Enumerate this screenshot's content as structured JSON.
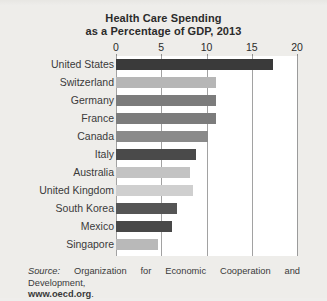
{
  "chart_data": {
    "type": "bar",
    "orientation": "horizontal",
    "title": "Health Care Spending as a Percentage of GDP, 2013",
    "title_lines": [
      "Health Care Spending",
      "as a Percentage of GDP, 2013"
    ],
    "xlabel": "",
    "ylabel": "",
    "xlim": [
      0,
      20
    ],
    "xticks": [
      0,
      5,
      10,
      15,
      20
    ],
    "xtick_labels": [
      "0",
      "5",
      "10",
      "15",
      "20"
    ],
    "grid": true,
    "legend": "none",
    "categories": [
      "United States",
      "Switzerland",
      "Germany",
      "France",
      "Canada",
      "Italy",
      "Australia",
      "United Kingdom",
      "South Korea",
      "Mexico",
      "Singapore"
    ],
    "values": [
      17.4,
      11.1,
      11.0,
      11.0,
      10.2,
      8.8,
      8.2,
      8.5,
      6.7,
      6.2,
      4.6
    ],
    "bar_colors": [
      "#3a3a3a",
      "#b6b6b6",
      "#7c7c7c",
      "#7c7c7c",
      "#8a8a8a",
      "#4a4a4a",
      "#c3c3c3",
      "#cfcfcf",
      "#555555",
      "#484848",
      "#b9b9b9"
    ]
  },
  "source": {
    "word": "Source:",
    "body": " Organization for Economic Cooperation and Development,",
    "url": "www.oecd.org",
    "period": "."
  },
  "colors": {
    "page_background": "#eeedea",
    "plot_background": "#ffffff",
    "gridline": "#a2a2a2",
    "text": "#2b2b2b"
  }
}
